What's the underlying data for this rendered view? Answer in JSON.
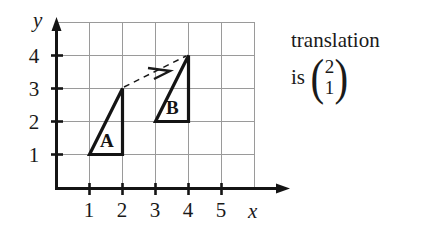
{
  "figure": {
    "kind": "coordinate-grid-translation-diagram",
    "axes": {
      "x_label": "x",
      "y_label": "y",
      "x_ticks": [
        "1",
        "2",
        "3",
        "4",
        "5"
      ],
      "y_ticks": [
        "1",
        "2",
        "3",
        "4"
      ],
      "x_range": [
        0,
        6
      ],
      "y_range": [
        0,
        5
      ],
      "grid": true,
      "grid_color": "#9a9a9a",
      "axis_color": "#141414"
    },
    "shapes": [
      {
        "label": "A",
        "vertices": [
          [
            1,
            1
          ],
          [
            2,
            1
          ],
          [
            2,
            3
          ]
        ],
        "label_position": [
          1.55,
          1.55
        ],
        "stroke": "#141414"
      },
      {
        "label": "B",
        "vertices": [
          [
            3,
            2
          ],
          [
            4,
            2
          ],
          [
            4,
            4
          ]
        ],
        "label_position": [
          3.55,
          2.55
        ],
        "stroke": "#141414"
      }
    ],
    "translation_arrow": {
      "from": [
        2,
        3
      ],
      "to": [
        4,
        4
      ],
      "style": "dashed",
      "color": "#1a1a1a"
    },
    "annotation": {
      "line1": "translation",
      "line2_prefix": "is",
      "vector_top": "2",
      "vector_bottom": "1",
      "paren_open": "(",
      "paren_close": ")"
    }
  }
}
